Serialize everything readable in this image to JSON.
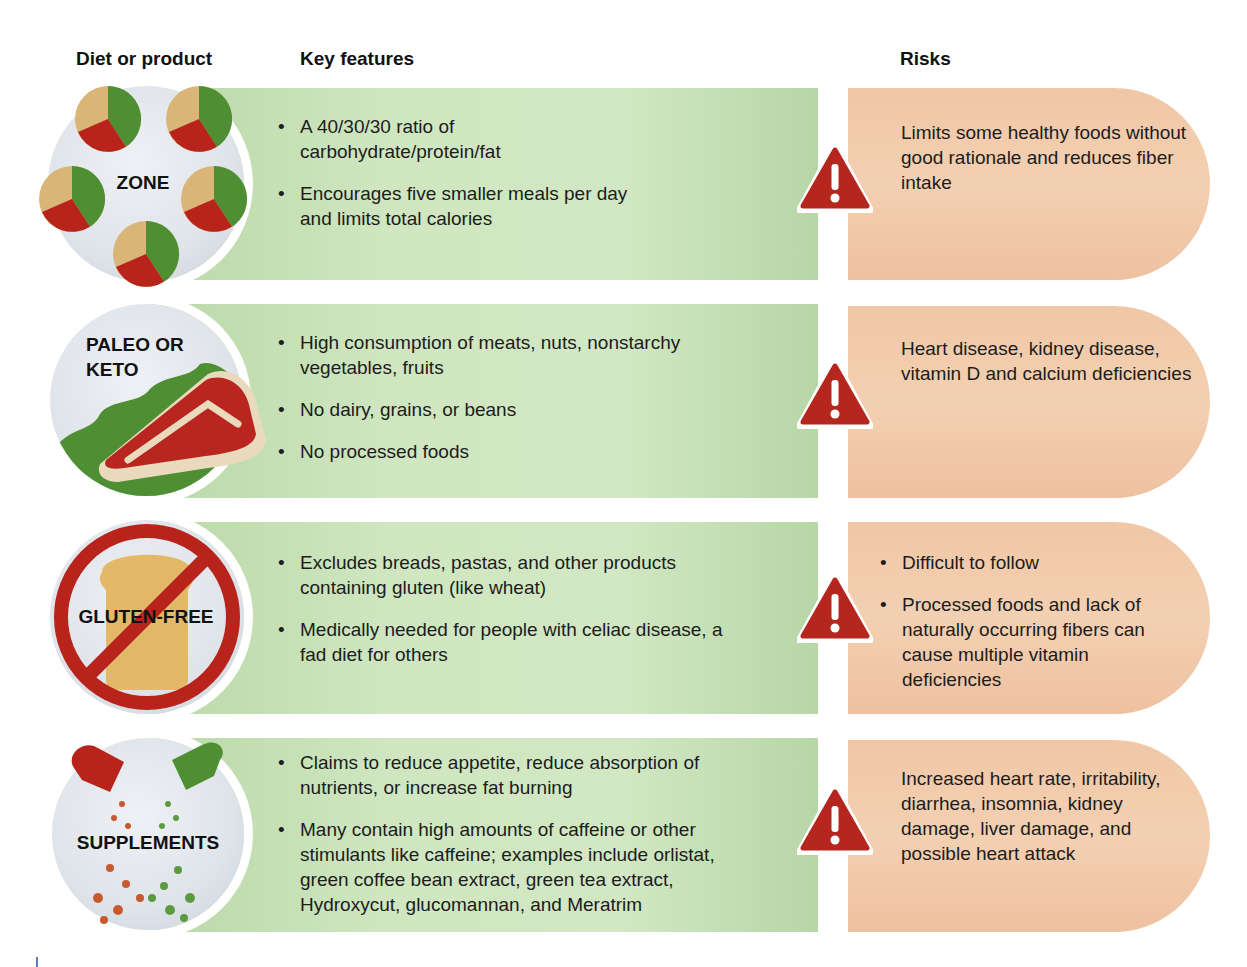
{
  "headers": {
    "diet": "Diet or product",
    "features": "Key features",
    "risks": "Risks"
  },
  "colors": {
    "features_band": "#cfe6c0",
    "risk_box": "#f0c7a6",
    "warning_red": "#b5261e",
    "pie_green": "#4f8f33",
    "pie_red": "#b8241c",
    "pie_tan": "#d9b677"
  },
  "rows": [
    {
      "name": "ZONE",
      "icon": "pie-charts-icon",
      "features": [
        "A 40/30/30 ratio of carbohydrate/protein/fat",
        "Encourages five smaller meals per day and limits total calories"
      ],
      "risk_type": "text",
      "risks": "Limits some healthy foods without good rationale and reduces fiber intake"
    },
    {
      "name_line1": "PALEO OR",
      "name_line2": "KETO",
      "icon": "steak-icon",
      "features": [
        "High consumption of meats, nuts, nonstarchy vegetables, fruits",
        "No dairy, grains, or beans",
        "No processed foods"
      ],
      "risk_type": "text",
      "risks": "Heart disease, kidney disease, vitamin D and calcium deficiencies"
    },
    {
      "name": "GLUTEN-FREE",
      "icon": "no-bread-icon",
      "features": [
        "Excludes breads, pastas, and other products containing gluten (like wheat)",
        "Medically needed for people with celiac disease, a fad diet for others"
      ],
      "risk_type": "list",
      "risks": [
        "Difficult to follow",
        "Processed foods and lack of naturally occurring fibers can cause multiple vitamin deficiencies"
      ]
    },
    {
      "name": "SUPPLEMENTS",
      "icon": "pills-icon",
      "features": [
        "Claims to reduce appetite, reduce absorption of nutrients, or increase fat burning",
        "Many contain high amounts of caffeine or other stimulants like caffeine; examples include orlistat, green coffee bean extract, green tea extract, Hydroxycut, glucomannan, and Meratrim"
      ],
      "risk_type": "text",
      "risks": "Increased heart rate, irritability, diarrhea, insomnia, kidney damage, liver damage, and possible heart attack"
    }
  ]
}
